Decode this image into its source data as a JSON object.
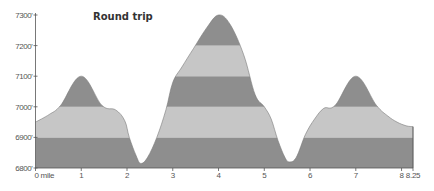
{
  "chart_data": {
    "type": "area",
    "title": "Round trip",
    "xlabel": "",
    "ylabel": "",
    "x_unit": "mile",
    "xlim": [
      0,
      8.25
    ],
    "ylim": [
      6800,
      7300
    ],
    "grid": false,
    "legend": null,
    "x_ticks": [
      0,
      1,
      2,
      3,
      4,
      5,
      6,
      7,
      8,
      8.25
    ],
    "x_tick_labels": [
      "0 mile",
      "1",
      "2",
      "3",
      "4",
      "5",
      "6",
      "7",
      "8",
      "8.25"
    ],
    "y_ticks": [
      6800,
      6900,
      7000,
      7100,
      7200,
      7300
    ],
    "y_tick_labels": [
      "6800'",
      "6900'",
      "7000'",
      "7100'",
      "7200'",
      "7300'"
    ],
    "elevation_bands": [
      {
        "from": 6800,
        "to": 6900,
        "color": "#8e8e8e"
      },
      {
        "from": 6900,
        "to": 7000,
        "color": "#c6c6c6"
      },
      {
        "from": 7000,
        "to": 7100,
        "color": "#8e8e8e"
      },
      {
        "from": 7100,
        "to": 7200,
        "color": "#c6c6c6"
      },
      {
        "from": 7200,
        "to": 7300,
        "color": "#8e8e8e"
      }
    ],
    "series": [
      {
        "name": "Elevation profile",
        "x": [
          0,
          0.3,
          0.55,
          1.0,
          1.45,
          1.75,
          1.95,
          2.05,
          2.2,
          2.3,
          2.45,
          2.65,
          2.85,
          3.0,
          3.2,
          3.45,
          3.75,
          4.0,
          4.25,
          4.55,
          4.8,
          5.0,
          5.15,
          5.3,
          5.45,
          5.55,
          5.7,
          5.9,
          6.1,
          6.3,
          6.55,
          7.0,
          7.45,
          7.7,
          7.9,
          8.1,
          8.25
        ],
        "y": [
          6950,
          6975,
          7005,
          7100,
          7005,
          6990,
          6955,
          6900,
          6840,
          6815,
          6835,
          6900,
          6990,
          7080,
          7130,
          7190,
          7260,
          7300,
          7270,
          7170,
          7040,
          7000,
          6960,
          6890,
          6835,
          6820,
          6835,
          6910,
          6960,
          6995,
          7005,
          7100,
          7005,
          6970,
          6950,
          6938,
          6935
        ]
      }
    ]
  },
  "colors": {
    "band_dark": "#8e8e8e",
    "band_light": "#c6c6c6",
    "axis": "#555555",
    "background": "#ffffff"
  }
}
